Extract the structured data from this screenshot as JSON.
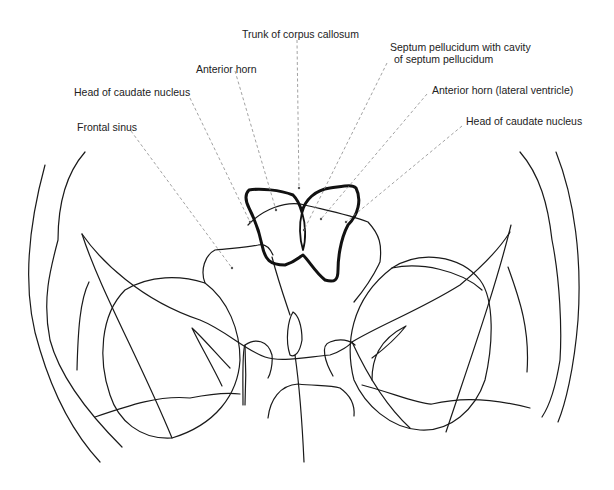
{
  "diagram": {
    "labels": [
      {
        "id": "trunk-corpus-callosum",
        "text": "Trunk of corpus callosum",
        "x": 242,
        "y": 28
      },
      {
        "id": "anterior-horn",
        "text": "Anterior horn",
        "x": 196,
        "y": 63
      },
      {
        "id": "head-caudate-left",
        "text": "Head of caudate nucleus",
        "x": 74,
        "y": 86
      },
      {
        "id": "frontal-sinus",
        "text": "Frontal sinus",
        "x": 77,
        "y": 121
      },
      {
        "id": "septum-pellucidum-line1",
        "text": "Septum pellucidum with cavity",
        "x": 390,
        "y": 41
      },
      {
        "id": "septum-pellucidum-line2",
        "text": "of septum pellucidum",
        "x": 394,
        "y": 53
      },
      {
        "id": "anterior-horn-lateral",
        "text": "Anterior horn (lateral ventricle)",
        "x": 432,
        "y": 84
      },
      {
        "id": "head-caudate-right",
        "text": "Head of caudate nucleus",
        "x": 466,
        "y": 115
      }
    ],
    "colors": {
      "outline": "#1a1a1a",
      "ventricle_outline": "#111111",
      "leader_line": "#8a8a8a",
      "label_text": "#222222",
      "background": "#ffffff"
    }
  }
}
